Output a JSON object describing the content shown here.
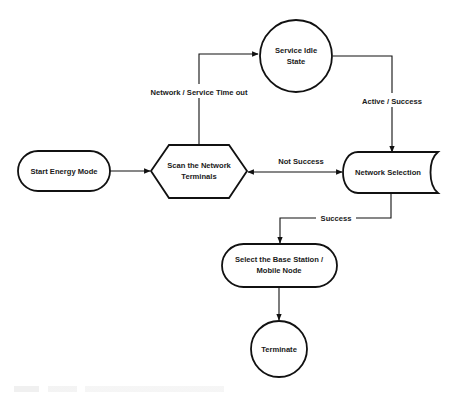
{
  "diagram": {
    "type": "flowchart",
    "colors": {
      "stroke": "#111111",
      "fill": "#ffffff",
      "text": "#1a1a1a"
    },
    "nodes": [
      {
        "id": "start",
        "shape": "rounded-pill",
        "lines": [
          "Start  Energy Mode"
        ]
      },
      {
        "id": "scan",
        "shape": "hexagon",
        "lines": [
          "Scan the Network",
          "Terminals"
        ]
      },
      {
        "id": "idle",
        "shape": "circle",
        "lines": [
          "Service Idle",
          "State"
        ]
      },
      {
        "id": "select",
        "shape": "stored-data",
        "lines": [
          "Network Selection"
        ]
      },
      {
        "id": "base",
        "shape": "rounded-pill",
        "lines": [
          "Select the Base Station /",
          "Mobile Node"
        ]
      },
      {
        "id": "term",
        "shape": "circle",
        "lines": [
          "Terminate"
        ]
      }
    ],
    "edges": [
      {
        "from": "start",
        "to": "scan",
        "label": ""
      },
      {
        "from": "scan",
        "to": "idle",
        "label": "Network / Service Time out"
      },
      {
        "from": "idle",
        "to": "select",
        "label": "Active / Success"
      },
      {
        "from": "select",
        "to": "scan",
        "label": "Not Success",
        "bidirectional": true
      },
      {
        "from": "select",
        "to": "base",
        "label": "Success"
      },
      {
        "from": "base",
        "to": "term",
        "label": ""
      }
    ]
  }
}
